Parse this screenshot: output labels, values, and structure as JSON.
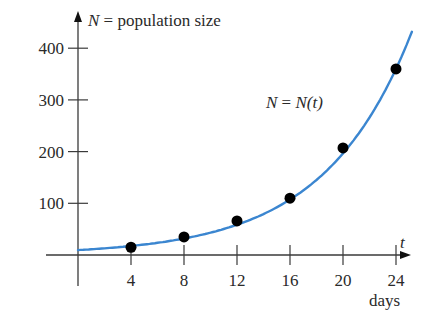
{
  "chart_data": {
    "type": "scatter",
    "title": "",
    "xlabel": "t",
    "xlabel_unit": "days",
    "ylabel": "N = population size",
    "curve_label": "N = N(t)",
    "x_ticks": [
      4,
      8,
      12,
      16,
      20,
      24
    ],
    "y_ticks": [
      100,
      200,
      300,
      400
    ],
    "xlim": [
      0,
      25.5
    ],
    "ylim": [
      0,
      430
    ],
    "grid": false,
    "legend": "none",
    "series": [
      {
        "name": "observed population",
        "type": "scatter",
        "x": [
          4,
          8,
          12,
          16,
          20,
          24
        ],
        "y": [
          15,
          35,
          66,
          110,
          207,
          360
        ]
      },
      {
        "name": "N = N(t)",
        "type": "line",
        "model": "exponential fit",
        "color": "#3b86d0"
      }
    ]
  },
  "labels": {
    "y_axis_var": "N",
    "y_axis_text": " = population size",
    "x_axis_var": "t",
    "x_axis_unit": "days",
    "curve_lhs": "N",
    "curve_eq": " = ",
    "curve_rhs": "N(t)"
  },
  "colors": {
    "curve": "#3b86d0",
    "points": "#000000",
    "axes": "#3a3a3a"
  }
}
